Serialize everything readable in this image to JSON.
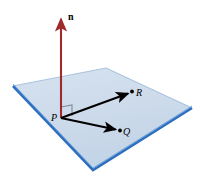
{
  "figure": {
    "background_color": "#ffffff",
    "plane": {
      "name": "plane",
      "fill_color": "#cfdceb",
      "edge_color_front": "#2f6fbf",
      "edge_color_back": "#a9c3de",
      "corners": [
        {
          "name": "left",
          "x": 13,
          "y": 86
        },
        {
          "name": "top",
          "x": 106,
          "y": 68
        },
        {
          "name": "right",
          "x": 192,
          "y": 108
        },
        {
          "name": "bottom",
          "x": 93,
          "y": 170
        }
      ]
    },
    "normal_vector": {
      "label": "n",
      "label_style": "bold-upright",
      "color": "#9e2b2b",
      "tail": {
        "x": 61,
        "y": 118
      },
      "tip": {
        "x": 61,
        "y": 14
      }
    },
    "right_angle_marker": {
      "name": "right-angle-marker",
      "color": "#6b7a88",
      "size": 11
    },
    "points": [
      {
        "label": "P",
        "label_style": "italic",
        "x": 61,
        "y": 118,
        "dot": false
      },
      {
        "label": "Q",
        "label_style": "italic",
        "x": 120,
        "y": 131,
        "dot": true
      },
      {
        "label": "R",
        "label_style": "italic",
        "x": 132,
        "y": 92,
        "dot": true
      }
    ],
    "vectors": [
      {
        "name": "vector-pq",
        "from": "P",
        "to": "Q",
        "color": "#000000",
        "tail": {
          "x": 61,
          "y": 118
        },
        "tip": {
          "x": 117,
          "y": 130
        }
      },
      {
        "name": "vector-pr",
        "from": "P",
        "to": "R",
        "color": "#000000",
        "tail": {
          "x": 61,
          "y": 118
        },
        "tip": {
          "x": 129,
          "y": 93
        }
      }
    ]
  }
}
